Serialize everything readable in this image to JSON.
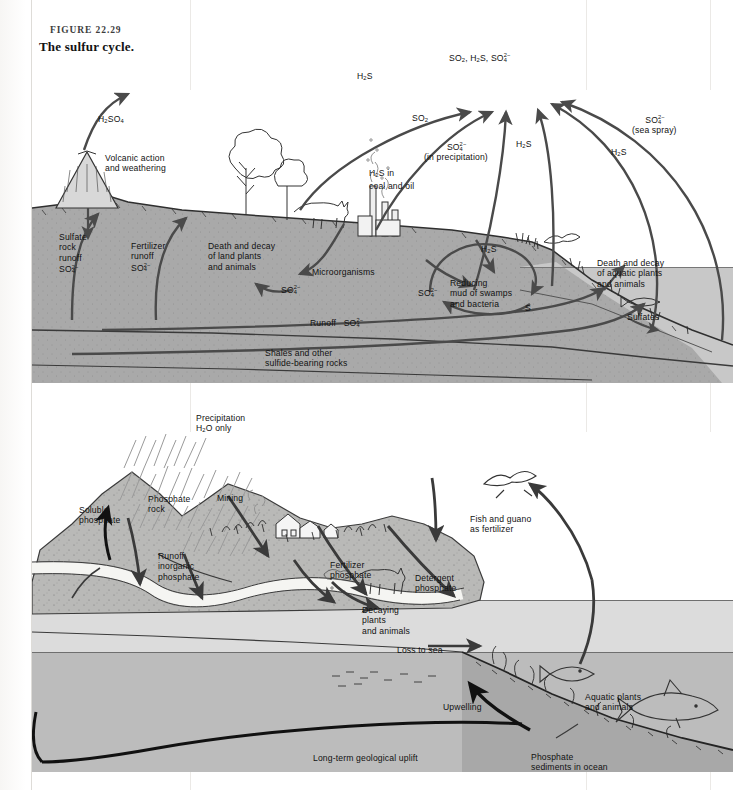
{
  "figure": {
    "number": "FIGURE  22.29",
    "title": "The sulfur cycle."
  },
  "colors": {
    "page": "#fdfdfc",
    "land_gray": "#a9a9a9",
    "land_stipple": "#b8b8b6",
    "ocean_gray": "#bdbdbd",
    "ocean_light": "#d2d2d2",
    "arrow": "#4a4a4a",
    "arrow_dark": "#1a1a1a",
    "ink": "#111111"
  },
  "panels": [
    {
      "id": "sulfur-cycle",
      "name": "The sulfur cycle",
      "labels": [
        {
          "id": "atmosphere-pool",
          "text": "SO₂, H₂S, SO₄²⁻",
          "x": 449,
          "y": 52,
          "role": "atmospheric-reservoir"
        },
        {
          "id": "h2so4",
          "text": "H₂SO₄",
          "x": 98,
          "y": 114,
          "role": "flux"
        },
        {
          "id": "volcanic",
          "text": "Volcanic action\nand weathering",
          "x": 105,
          "y": 153,
          "role": "source"
        },
        {
          "id": "h2s-left",
          "text": "H₂S",
          "x": 357,
          "y": 71,
          "role": "flux"
        },
        {
          "id": "so2",
          "text": "SO₂",
          "x": 412,
          "y": 113,
          "role": "flux"
        },
        {
          "id": "so4-precip",
          "text": "SO₄²⁻\n(in precipitation)",
          "x": 424,
          "y": 141,
          "role": "flux"
        },
        {
          "id": "h2s-coal",
          "text": "H₂S in\ncoal and oil",
          "x": 369,
          "y": 168,
          "role": "source"
        },
        {
          "id": "h2s-mid",
          "text": "H₂S",
          "x": 516,
          "y": 139,
          "role": "flux"
        },
        {
          "id": "so4-sea-spray",
          "text": "SO₄²⁻\n(sea spray)",
          "x": 632,
          "y": 114,
          "role": "flux"
        },
        {
          "id": "h2s-right",
          "text": "H₂S",
          "x": 611,
          "y": 147,
          "role": "flux"
        },
        {
          "id": "sulfate-rock-runoff",
          "text": "Sulfate\nrock\nrunoff\nSO₄²⁻",
          "x": 59,
          "y": 232,
          "role": "flux"
        },
        {
          "id": "fertilizer-runoff",
          "text": "Fertilizer\nrunoff\nSO₄²⁻",
          "x": 131,
          "y": 241,
          "role": "flux"
        },
        {
          "id": "death-decay-land",
          "text": "Death and decay\nof land plants\nand animals",
          "x": 208,
          "y": 241,
          "role": "process"
        },
        {
          "id": "microorganisms",
          "text": "Microorganisms",
          "x": 312,
          "y": 267,
          "role": "process"
        },
        {
          "id": "so4-micro",
          "text": "SO₄²⁻",
          "x": 281,
          "y": 284,
          "role": "flux"
        },
        {
          "id": "so4-reducing",
          "text": "SO₄²⁻",
          "x": 418,
          "y": 287,
          "role": "flux"
        },
        {
          "id": "reducing-mud",
          "text": "Reducing\nmud of swamps\nand bacteria",
          "x": 450,
          "y": 278,
          "role": "process"
        },
        {
          "id": "sulfur-elemental",
          "text": "S",
          "x": 525,
          "y": 303,
          "role": "flux"
        },
        {
          "id": "h2s-shore",
          "text": "H₂S",
          "x": 481,
          "y": 244,
          "role": "flux"
        },
        {
          "id": "runoff-so4",
          "text": "Runoff   SO₄²⁻",
          "x": 310,
          "y": 317,
          "role": "flux"
        },
        {
          "id": "shales",
          "text": "Shales and other\nsulfide-bearing rocks",
          "x": 265,
          "y": 348,
          "role": "reservoir"
        },
        {
          "id": "death-decay-aquatic",
          "text": "Death and decay\nof aquatic plants\nand animals",
          "x": 597,
          "y": 258,
          "role": "process"
        },
        {
          "id": "sulfates",
          "text": "Sulfates",
          "x": 627,
          "y": 312,
          "role": "reservoir"
        }
      ],
      "features": [
        "volcano",
        "deciduous-tree",
        "shrub",
        "cow",
        "factory-smokestacks",
        "seagull",
        "fish",
        "grass-shoreline",
        "ocean",
        "bedrock-layers"
      ]
    },
    {
      "id": "phosphorus-cycle",
      "name": "The phosphorus cycle",
      "labels": [
        {
          "id": "precipitation",
          "text": "Precipitation\nH₂O only",
          "x": 196,
          "y": 413,
          "role": "source"
        },
        {
          "id": "soluble-phosphate",
          "text": "Soluble\nphosphate",
          "x": 79,
          "y": 505,
          "role": "flux"
        },
        {
          "id": "phosphate-rock",
          "text": "Phosphate\nrock",
          "x": 148,
          "y": 494,
          "role": "reservoir"
        },
        {
          "id": "mining",
          "text": "Mining",
          "x": 217,
          "y": 493,
          "role": "flux"
        },
        {
          "id": "runoff-inorganic",
          "text": "Runoff\ninorganic\nphosphate",
          "x": 158,
          "y": 551,
          "role": "flux"
        },
        {
          "id": "fertilizer-phosphate",
          "text": "Fertilizer\nphosphate",
          "x": 330,
          "y": 560,
          "role": "flux"
        },
        {
          "id": "detergent-phosphate",
          "text": "Detergent\nphosphate",
          "x": 415,
          "y": 573,
          "role": "flux"
        },
        {
          "id": "decaying-plants",
          "text": "Decaying\nplants\nand animals",
          "x": 362,
          "y": 605,
          "role": "process"
        },
        {
          "id": "fish-guano",
          "text": "Fish and guano\nas fertilizer",
          "x": 470,
          "y": 514,
          "role": "flux"
        },
        {
          "id": "loss-to-sea",
          "text": "Loss to sea",
          "x": 397,
          "y": 645,
          "role": "flux"
        },
        {
          "id": "upwelling",
          "text": "Upwelling",
          "x": 443,
          "y": 702,
          "role": "flux"
        },
        {
          "id": "aquatic-plants",
          "text": "Aquatic plants\nand animals",
          "x": 585,
          "y": 692,
          "role": "process"
        },
        {
          "id": "long-term-uplift",
          "text": "Long-term geological uplift",
          "x": 313,
          "y": 753,
          "role": "flux"
        },
        {
          "id": "phosphate-sediments",
          "text": "Phosphate\nsediments in ocean",
          "x": 531,
          "y": 752,
          "role": "reservoir"
        }
      ],
      "features": [
        "rain-hatching",
        "phosphate-mountain",
        "aquifer-channel",
        "farm-houses",
        "crops",
        "cow",
        "seagull",
        "fish-school",
        "fish",
        "shark",
        "ocean-floor-sediments"
      ]
    }
  ]
}
